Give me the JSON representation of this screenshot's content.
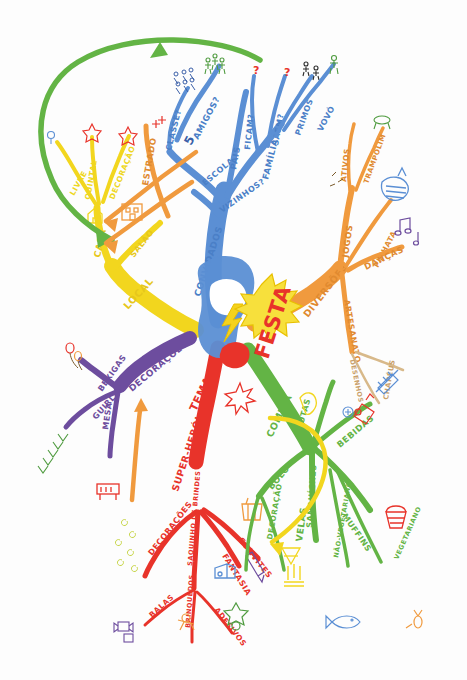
{
  "diagram": {
    "type": "mind-map",
    "title": "FESTA",
    "language": "pt-BR",
    "style": "hand-drawn colored marker mind map on white paper",
    "center": {
      "label": "FESTA",
      "color": "#e8332a",
      "burst_color": "#f5d21c",
      "icon": "lightning-bolt-icon",
      "icon_color": "#f5d21c",
      "central_image_color": "#5b8fd4"
    },
    "branches": [
      {
        "id": "convidados",
        "label": "CONVIDADOS",
        "color": "#5b8fd4",
        "children": [
          {
            "label": "ESCOLA",
            "color": "#5b8fd4",
            "children": [
              {
                "label": "CLASSE?",
                "icon": "group-of-people-icon"
              },
              {
                "label": "AMIGOS?",
                "icon": "three-friends-icon",
                "count": "5"
              }
            ]
          },
          {
            "label": "VIZINHOS?",
            "color": "#5b8fd4",
            "children": []
          },
          {
            "label": "PAIS",
            "color": "#5b8fd4",
            "children": []
          },
          {
            "label": "FAMÍLIA",
            "color": "#5b8fd4",
            "children": [
              {
                "label": "FICAM?",
                "icon": "question-mark-icon"
              },
              {
                "label": "SAEM?",
                "icon": "question-mark-icon"
              },
              {
                "label": "PRIMOS",
                "icon": "children-icon"
              },
              {
                "label": "VOVÓ",
                "icon": "elderly-person-icon"
              }
            ]
          }
        ]
      },
      {
        "id": "local",
        "label": "LOCAL",
        "color": "#f2d61e",
        "children": [
          {
            "label": "CASA",
            "color": "#f2d61e",
            "children": [
              {
                "label": "LIVRE",
                "icon": "balloon-icon"
              },
              {
                "label": "QUINTAL",
                "icon": "star-icon"
              },
              {
                "label": "DECORAÇÃO",
                "icon": "star-icon"
              }
            ]
          },
          {
            "label": "SALÃO",
            "color": "#f2d61e",
            "icon": "building-icon",
            "children": []
          }
        ]
      },
      {
        "id": "estrado",
        "label": "ESTRADO",
        "color": "#f09a3e",
        "children": [
          {
            "label": "CONVITE",
            "icon": "people-icon"
          }
        ]
      },
      {
        "id": "decoracoes",
        "label": "DECORAÇÕES",
        "color": "#6d4d9e",
        "children": [
          {
            "label": "BEXIGAS",
            "color": "#6d4d9e",
            "icon": "balloons-icon"
          },
          {
            "label": "GUIRLANDAS",
            "color": "#6d4d9e",
            "icon": "garland-icon"
          },
          {
            "label": "MESA",
            "color": "#6d4d9e",
            "icon": "table-icon"
          }
        ]
      },
      {
        "id": "tema",
        "label": "TEMA",
        "color": "#e8332a",
        "children": [
          {
            "label": "SUPER-HERÓI",
            "color": "#e8332a",
            "icon": "star-burst-icon"
          },
          {
            "label": "DECORAÇÕES",
            "color": "#e8332a",
            "icon": "confetti-icon"
          },
          {
            "label": "SAQUINHO DE BRINDES",
            "color": "#e8332a",
            "children": [
              {
                "label": "BALAS",
                "icon": "candy-icon"
              },
              {
                "label": "BRINQUEDOS",
                "icon": "toy-icon"
              },
              {
                "label": "ADESIVOS",
                "icon": "sticker-icon"
              }
            ]
          },
          {
            "label": "FANTASIA",
            "color": "#e8332a",
            "icon": "costume-icon"
          },
          {
            "label": "CONVITES",
            "color": "#e8332a",
            "icon": "pen-icon"
          }
        ]
      },
      {
        "id": "comida",
        "label": "COMIDA",
        "color": "#63b445",
        "children": [
          {
            "label": "BOLO",
            "color": "#63b445",
            "icon": "cake-icon",
            "children": [
              {
                "label": "DECORAÇÃO",
                "icon": "cake-decor-icon"
              },
              {
                "label": "VELAS",
                "icon": "candles-icon"
              }
            ]
          },
          {
            "label": "SANDUÍCHES",
            "color": "#63b445",
            "children": [
              {
                "label": "NÃO-VEGETARIANO",
                "icon": "fish-icon"
              },
              {
                "label": "VEGETARIANO",
                "icon": "vegetable-icon"
              }
            ]
          },
          {
            "label": "MUFFINS",
            "color": "#63b445",
            "icon": "muffin-icon"
          },
          {
            "label": "FRUTAS",
            "color": "#63b445",
            "icon": "fruit-icon"
          },
          {
            "label": "BEBIDAS",
            "color": "#63b445",
            "icon": "juice-bottle-icon"
          }
        ]
      },
      {
        "id": "diversoes",
        "label": "DIVERSÕES",
        "color": "#f09a3e",
        "children": [
          {
            "label": "JOGOS",
            "color": "#f09a3e",
            "children": [
              {
                "label": "ATIVOS",
                "icon": "running-icon"
              },
              {
                "label": "TRAMPOLIM",
                "icon": "trampoline-icon"
              },
              {
                "label": "PINHATA",
                "icon": "pinata-icon"
              }
            ]
          },
          {
            "label": "DANÇAS",
            "color": "#f09a3e",
            "icon": "music-notes-icon"
          },
          {
            "label": "ARTESANATO",
            "color": "#f09a3e",
            "children": [
              {
                "label": "DESENHOS",
                "icon": "drawing-icon"
              },
              {
                "label": "CHAPÉUS",
                "icon": "hat-icon"
              }
            ]
          }
        ]
      }
    ],
    "arrows": [
      {
        "name": "green-sweep-arrow",
        "color": "#63b445",
        "from": "comida-area",
        "to": "local-casa"
      },
      {
        "name": "orange-arrow-1",
        "color": "#f09a3e",
        "to": "local-casa"
      },
      {
        "name": "orange-arrow-2",
        "color": "#f09a3e",
        "to": "local-casa"
      },
      {
        "name": "orange-arrow-up",
        "color": "#f09a3e",
        "to": "decoracoes-mesa"
      },
      {
        "name": "yellow-arrow-down",
        "color": "#f2d61e",
        "to": "tema-convites"
      }
    ]
  }
}
